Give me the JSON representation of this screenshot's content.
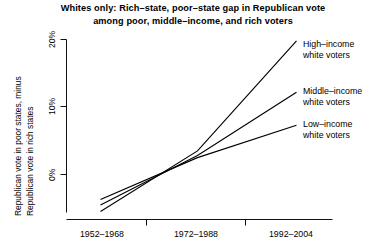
{
  "chart_data": {
    "type": "line",
    "title_lines": [
      "Whites only:  Rich–state, poor–state gap in Republican vote",
      "among poor, middle–income, and rich voters"
    ],
    "xlabel": "",
    "ylabel": "Republican vote in poor states, minus Republican vote in rich states",
    "ylabel_lines": [
      "Republican vote in poor states, minus",
      "Republican vote in rich states"
    ],
    "categories": [
      "1952–1968",
      "1972–1988",
      "1992–2004"
    ],
    "xticklabels": [
      "1952–1968",
      "1972–1988",
      "1992–2004"
    ],
    "yticklabels": [
      "0%",
      "10%",
      "20%"
    ],
    "ytickvalues": [
      0,
      10,
      20
    ],
    "ylim": [
      -7,
      21
    ],
    "xlim": [
      0,
      3.4
    ],
    "grid": false,
    "legend_position": "right-inline-annotations",
    "line_color": "#000000",
    "series": [
      {
        "name": "High–income white voters",
        "label_lines": [
          "High–income",
          "white voters"
        ],
        "values": [
          -5.5,
          3.5,
          19.8
        ]
      },
      {
        "name": "Middle–income white voters",
        "label_lines": [
          "Middle–income",
          "white voters"
        ],
        "values": [
          -4.5,
          2.8,
          12.2
        ]
      },
      {
        "name": "Low–income white voters",
        "label_lines": [
          "Low–income",
          "white voters"
        ],
        "values": [
          -3.7,
          2.5,
          7.3
        ]
      }
    ]
  }
}
